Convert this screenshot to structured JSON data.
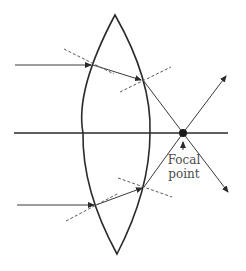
{
  "diagram": {
    "focal_label_line1": "Focal",
    "focal_label_line2": "point",
    "colors": {
      "line": "#2a2a2a",
      "ray": "#3a3a3a",
      "normal": "#5a5a5a",
      "text": "#4a4a4a"
    }
  }
}
